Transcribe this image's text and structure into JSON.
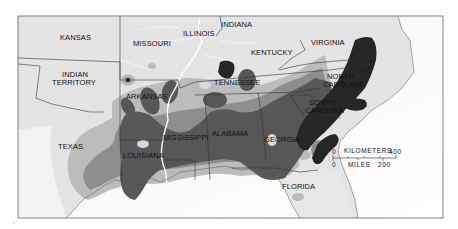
{
  "map": {
    "type": "choropleth-density",
    "colors": {
      "background": "#ffffff",
      "land": "#e6e6e6",
      "land_light": "#efefef",
      "sea": "#f8f8f8",
      "density_low": "#bcbcbc",
      "density_mid": "#8c8c8c",
      "density_high": "#585858",
      "density_highest": "#2a2a2a",
      "border": "#333333",
      "river": "#ffffff",
      "frame": "#666666"
    },
    "labels": {
      "kansas": "KANSAS",
      "missouri": "MISSOURI",
      "illinois": "ILLINOIS",
      "indiana": "INDIANA",
      "kentucky": "KENTUCKY",
      "virginia": "VIRGINIA",
      "indian_territory_1": "INDIAN",
      "indian_territory_2": "TERRITORY",
      "arkansas": "ARKANSAS",
      "tennessee": "TENNESSEE",
      "north_carolina_1": "NORTH",
      "north_carolina_2": "CAROLINA",
      "south_carolina_1": "SOUTH",
      "south_carolina_2": "CAROLINA",
      "texas": "TEXAS",
      "louisiana": "LOUISIANA",
      "mississippi": "MISSISSIPPI",
      "alabama": "ALABAMA",
      "georgia": "GEORGIA",
      "florida": "FLORIDA"
    },
    "scale_bar": {
      "km_start": "0",
      "km_label": "KILOMETERS",
      "km_end": "400",
      "mi_start": "0",
      "mi_label": "MILES",
      "mi_end": "200"
    }
  }
}
